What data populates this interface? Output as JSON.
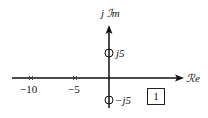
{
  "diagram": {
    "type": "pole-zero-plot",
    "axes": {
      "real_label": "ℛe",
      "imag_label_prefix": "j",
      "imag_label": "ℐm"
    },
    "poles": [
      {
        "value": -10,
        "label": "−10",
        "marker": "x"
      },
      {
        "value": -5,
        "label": "−5",
        "marker": "x"
      }
    ],
    "zeros": [
      {
        "value": "j5",
        "label": "j5",
        "marker": "o"
      },
      {
        "value": "-j5",
        "label": "−j5",
        "marker": "o"
      }
    ],
    "figure_number": "1",
    "colors": {
      "stroke": "#111111",
      "background": "#ffffff"
    }
  }
}
